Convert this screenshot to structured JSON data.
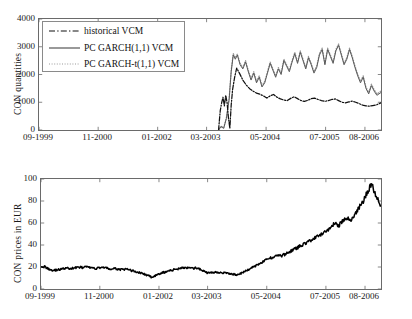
{
  "figure": {
    "background": "#ffffff",
    "axis_color": "#6a6a6a",
    "line_color_solid": "#555555",
    "line_color_dashed": "#111111",
    "line_color_dotted": "#999999",
    "price_line_color": "#000000"
  },
  "top_panel": {
    "ylabel": "CON quantities",
    "yticks": [
      "0",
      "1000",
      "2000",
      "3000",
      "4000"
    ],
    "xticks": [
      "09-1999",
      "11-2000",
      "01-2002",
      "03-2003",
      "05-2004",
      "07-2005",
      "08-2006"
    ],
    "legend": {
      "items": [
        {
          "label": "historical VCM",
          "style": "dashdot"
        },
        {
          "label": "PC GARCH(1,1) VCM",
          "style": "solid"
        },
        {
          "label": "PC GARCH-t(1,1) VCM",
          "style": "dotted"
        }
      ]
    }
  },
  "bottom_panel": {
    "ylabel": "CON prices in EUR",
    "yticks": [
      "0",
      "20",
      "40",
      "60",
      "80",
      "100"
    ],
    "xticks": [
      "09-1999",
      "11-2000",
      "01-2002",
      "03-2003",
      "05-2004",
      "07-2005",
      "08-2006"
    ]
  },
  "chart_data": [
    {
      "type": "line",
      "title": "",
      "xlabel": "",
      "ylabel": "CON quantities",
      "ylim": [
        0,
        4000
      ],
      "yticks": [
        0,
        1000,
        2000,
        3000,
        4000
      ],
      "grid": false,
      "legend_position": "upper-left",
      "x_tick_labels": [
        "09-1999",
        "11-2000",
        "01-2002",
        "03-2003",
        "05-2004",
        "07-2005",
        "08-2006"
      ],
      "x_tick_fracs": [
        0.0,
        0.173,
        0.347,
        0.49,
        0.664,
        0.838,
        0.953
      ],
      "note": "Series begin only after ~mid-2003 (x fraction ~0.525); before that nothing is drawn.",
      "series": [
        {
          "name": "historical VCM",
          "style": "dashdot",
          "color": "#111111",
          "x": [
            0.525,
            0.53,
            0.534,
            0.538,
            0.542,
            0.546,
            0.55,
            0.554,
            0.558,
            0.562,
            0.566,
            0.572,
            0.578,
            0.586,
            0.596,
            0.606,
            0.616,
            0.626,
            0.636,
            0.646,
            0.656,
            0.666,
            0.676,
            0.686,
            0.696,
            0.706,
            0.716,
            0.726,
            0.736,
            0.746,
            0.756,
            0.766,
            0.776,
            0.786,
            0.796,
            0.806,
            0.816,
            0.826,
            0.836,
            0.846,
            0.856,
            0.866,
            0.876,
            0.886,
            0.896,
            0.906,
            0.916,
            0.926,
            0.936,
            0.946,
            0.956,
            0.966,
            0.976,
            0.986,
            1.0
          ],
          "y": [
            0,
            700,
            980,
            1180,
            870,
            1250,
            980,
            430,
            60,
            900,
            1450,
            1900,
            2230,
            2050,
            1800,
            1620,
            1490,
            1400,
            1330,
            1290,
            1230,
            1150,
            1230,
            1280,
            1180,
            1120,
            1080,
            1060,
            1140,
            1200,
            1130,
            1060,
            1030,
            1070,
            1130,
            1150,
            1100,
            1060,
            1030,
            1060,
            1100,
            1120,
            1060,
            1000,
            980,
            1010,
            1040,
            1000,
            950,
            900,
            870,
            860,
            880,
            900,
            980
          ]
        },
        {
          "name": "PC GARCH(1,1) VCM",
          "style": "solid",
          "color": "#555555",
          "x": [
            0.525,
            0.532,
            0.54,
            0.548,
            0.556,
            0.562,
            0.568,
            0.574,
            0.58,
            0.588,
            0.596,
            0.604,
            0.612,
            0.62,
            0.628,
            0.636,
            0.644,
            0.652,
            0.66,
            0.668,
            0.676,
            0.684,
            0.692,
            0.7,
            0.708,
            0.716,
            0.724,
            0.732,
            0.74,
            0.748,
            0.756,
            0.764,
            0.772,
            0.78,
            0.788,
            0.796,
            0.804,
            0.812,
            0.82,
            0.828,
            0.836,
            0.844,
            0.852,
            0.86,
            0.868,
            0.876,
            0.884,
            0.892,
            0.9,
            0.908,
            0.916,
            0.924,
            0.932,
            0.94,
            0.948,
            0.956,
            0.964,
            0.972,
            0.98,
            0.988,
            1.0
          ],
          "y": [
            0,
            120,
            60,
            420,
            1100,
            2100,
            2700,
            2550,
            2700,
            2350,
            2200,
            2450,
            2100,
            1800,
            2050,
            1700,
            1900,
            1550,
            1700,
            2050,
            2400,
            2150,
            1900,
            2200,
            2000,
            2500,
            2300,
            2100,
            2450,
            2750,
            2400,
            2800,
            2500,
            2200,
            2600,
            2350,
            2050,
            2250,
            2700,
            2900,
            2350,
            2900,
            2650,
            2400,
            2850,
            3050,
            2700,
            2350,
            2550,
            2900,
            2600,
            2250,
            1950,
            1700,
            1900,
            1500,
            1300,
            1600,
            1400,
            1250,
            1350
          ]
        },
        {
          "name": "PC GARCH-t(1,1) VCM",
          "style": "dotted",
          "color": "#999999",
          "x": [
            0.525,
            0.532,
            0.54,
            0.548,
            0.556,
            0.562,
            0.568,
            0.574,
            0.58,
            0.588,
            0.596,
            0.604,
            0.612,
            0.62,
            0.628,
            0.636,
            0.644,
            0.652,
            0.66,
            0.668,
            0.676,
            0.684,
            0.692,
            0.7,
            0.708,
            0.716,
            0.724,
            0.732,
            0.74,
            0.748,
            0.756,
            0.764,
            0.772,
            0.78,
            0.788,
            0.796,
            0.804,
            0.812,
            0.82,
            0.828,
            0.836,
            0.844,
            0.852,
            0.86,
            0.868,
            0.876,
            0.884,
            0.892,
            0.9,
            0.908,
            0.916,
            0.924,
            0.932,
            0.94,
            0.948,
            0.956,
            0.964,
            0.972,
            0.98,
            0.988,
            1.0
          ],
          "y": [
            0,
            140,
            80,
            450,
            1150,
            2150,
            2760,
            2600,
            2740,
            2400,
            2250,
            2500,
            2150,
            1850,
            2100,
            1750,
            1950,
            1600,
            1750,
            2100,
            2450,
            2200,
            1950,
            2250,
            2050,
            2550,
            2350,
            2150,
            2500,
            2800,
            2450,
            2850,
            2550,
            2250,
            2650,
            2400,
            2100,
            2300,
            2750,
            2950,
            2400,
            2950,
            2700,
            2450,
            2900,
            3100,
            2750,
            2400,
            2600,
            2950,
            2650,
            2300,
            2000,
            1750,
            1950,
            1550,
            1350,
            1650,
            1450,
            1300,
            1400
          ]
        }
      ]
    },
    {
      "type": "line",
      "title": "",
      "xlabel": "",
      "ylabel": "CON prices in EUR",
      "ylim": [
        0,
        100
      ],
      "yticks": [
        0,
        20,
        40,
        60,
        80,
        100
      ],
      "grid": false,
      "x_tick_labels": [
        "09-1999",
        "11-2000",
        "01-2002",
        "03-2003",
        "05-2004",
        "07-2005",
        "08-2006"
      ],
      "x_tick_fracs": [
        0.0,
        0.173,
        0.347,
        0.49,
        0.664,
        0.838,
        0.953
      ],
      "series": [
        {
          "name": "CON price",
          "style": "solid",
          "color": "#000000",
          "x": [
            0.0,
            0.012,
            0.024,
            0.036,
            0.048,
            0.06,
            0.072,
            0.084,
            0.096,
            0.108,
            0.12,
            0.132,
            0.144,
            0.156,
            0.168,
            0.18,
            0.192,
            0.204,
            0.216,
            0.228,
            0.24,
            0.252,
            0.264,
            0.276,
            0.288,
            0.3,
            0.312,
            0.324,
            0.336,
            0.348,
            0.36,
            0.372,
            0.384,
            0.396,
            0.408,
            0.42,
            0.432,
            0.444,
            0.456,
            0.468,
            0.48,
            0.492,
            0.504,
            0.516,
            0.528,
            0.54,
            0.552,
            0.564,
            0.576,
            0.588,
            0.6,
            0.612,
            0.624,
            0.636,
            0.648,
            0.66,
            0.672,
            0.684,
            0.696,
            0.708,
            0.72,
            0.732,
            0.744,
            0.756,
            0.768,
            0.78,
            0.792,
            0.804,
            0.816,
            0.828,
            0.84,
            0.852,
            0.864,
            0.876,
            0.888,
            0.9,
            0.912,
            0.924,
            0.936,
            0.948,
            0.96,
            0.972,
            0.984,
            1.0
          ],
          "y": [
            21,
            20,
            18,
            17,
            17.5,
            18,
            19,
            18.5,
            19,
            20,
            19.5,
            20,
            19.5,
            18.5,
            19,
            20,
            19,
            18,
            18.5,
            18,
            17.5,
            18,
            17,
            16,
            15,
            14,
            12.5,
            11,
            12,
            13.5,
            15,
            16,
            17,
            18,
            19,
            19.5,
            19,
            18.5,
            19,
            18,
            16,
            14.5,
            15,
            15.5,
            15,
            14.5,
            14,
            13.5,
            13,
            14,
            16,
            18,
            20,
            22,
            24,
            26,
            28,
            29,
            31,
            30,
            32,
            34,
            36,
            38,
            40,
            42,
            44,
            46,
            48,
            50,
            53,
            56,
            60,
            58,
            62,
            64,
            63,
            68,
            74,
            80,
            88,
            96,
            86,
            76
          ]
        }
      ]
    }
  ]
}
